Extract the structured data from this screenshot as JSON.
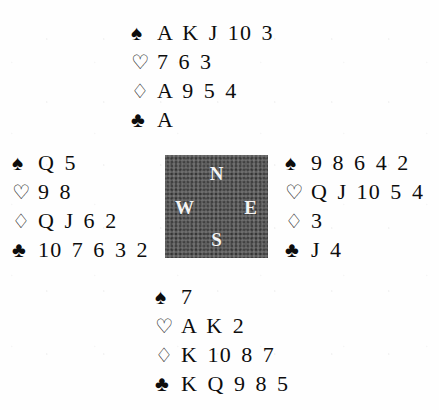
{
  "diagram": {
    "type": "bridge-deal",
    "suit_symbols": {
      "spade": "♠",
      "heart": "♡",
      "diamond": "♢",
      "club": "♣"
    },
    "suit_names": {
      "spade": "spades",
      "heart": "hearts",
      "diamond": "diamonds",
      "club": "clubs"
    },
    "colors": {
      "ink": "#0d0d0d",
      "paper": "#fefefe",
      "compass_fill": "#5c5c5c",
      "compass_text": "#f4f4f4"
    }
  },
  "compass": {
    "north": "N",
    "west": "W",
    "east": "E",
    "south": "S"
  },
  "hands": {
    "north": {
      "label": "North",
      "spades": "A K J 10 3",
      "hearts": "7 6 3",
      "diamonds": "A 9 5 4",
      "clubs": "A"
    },
    "west": {
      "label": "West",
      "spades": "Q 5",
      "hearts": "9 8",
      "diamonds": "Q J 6 2",
      "clubs": "10 7 6 3 2"
    },
    "east": {
      "label": "East",
      "spades": "9 8 6 4 2",
      "hearts": "Q J 10 5 4",
      "diamonds": "3",
      "clubs": "J 4"
    },
    "south": {
      "label": "South",
      "spades": "7",
      "hearts": "A K 2",
      "diamonds": "K 10 8 7",
      "clubs": "K Q 9 8 5"
    }
  }
}
